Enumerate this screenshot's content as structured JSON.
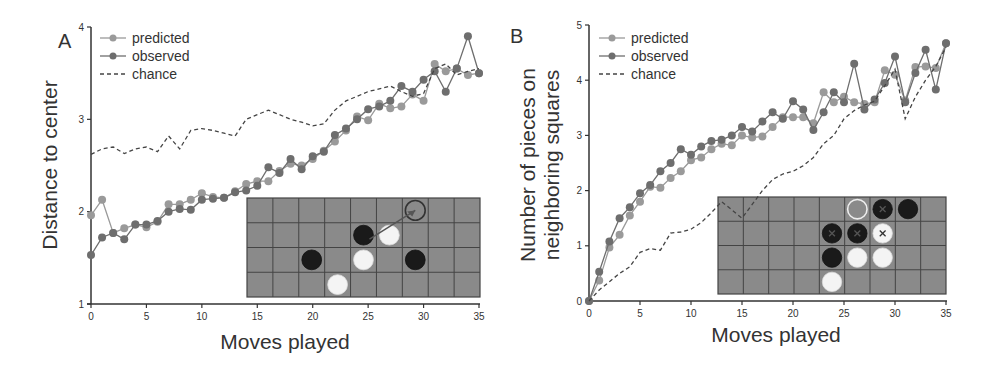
{
  "colors": {
    "predicted": "#9a9a9a",
    "observed": "#6e6e6e",
    "chance": "#444444",
    "axis": "#333333",
    "board": "#8a8a8a",
    "board_grid": "#444444",
    "black_piece": "#1a1a1a",
    "white_piece": "#f4f4f4"
  },
  "chart_data": [
    {
      "type": "line",
      "panel": "A",
      "title": "",
      "xlabel": "Moves played",
      "ylabel": "Distance to center",
      "xlim": [
        0,
        35
      ],
      "ylim": [
        1,
        4
      ],
      "xticks": [
        0,
        5,
        10,
        15,
        20,
        25,
        30,
        35
      ],
      "yticks": [
        1,
        2,
        3,
        4
      ],
      "legend": [
        "predicted",
        "observed",
        "chance"
      ],
      "legend_position": "upper left",
      "x": [
        0,
        1,
        2,
        3,
        4,
        5,
        6,
        7,
        8,
        9,
        10,
        11,
        12,
        13,
        14,
        15,
        16,
        17,
        18,
        19,
        20,
        21,
        22,
        23,
        24,
        25,
        26,
        27,
        28,
        29,
        30,
        31,
        32,
        33,
        34,
        35
      ],
      "series": [
        {
          "name": "predicted",
          "style": "line+marker",
          "values": [
            1.96,
            2.13,
            1.77,
            1.82,
            1.86,
            1.83,
            1.89,
            2.08,
            2.08,
            2.13,
            2.2,
            2.16,
            2.15,
            2.22,
            2.3,
            2.33,
            2.33,
            2.44,
            2.52,
            2.5,
            2.57,
            2.66,
            2.76,
            2.88,
            3.03,
            2.99,
            3.17,
            3.12,
            3.14,
            3.27,
            3.2,
            3.6,
            3.52,
            3.55,
            3.48,
            3.5
          ]
        },
        {
          "name": "observed",
          "style": "line+marker",
          "values": [
            1.53,
            1.72,
            1.77,
            1.7,
            1.86,
            1.86,
            1.9,
            2.0,
            2.03,
            2.02,
            2.13,
            2.14,
            2.15,
            2.21,
            2.23,
            2.28,
            2.48,
            2.42,
            2.57,
            2.46,
            2.6,
            2.65,
            2.83,
            2.9,
            3.0,
            3.11,
            3.14,
            3.2,
            3.36,
            3.3,
            3.43,
            3.52,
            3.3,
            3.55,
            3.9,
            3.5
          ]
        },
        {
          "name": "chance",
          "style": "dashed",
          "values": [
            2.62,
            2.68,
            2.7,
            2.63,
            2.68,
            2.7,
            2.65,
            2.82,
            2.68,
            2.88,
            2.9,
            2.88,
            2.85,
            2.82,
            3.0,
            3.05,
            3.1,
            3.05,
            3.0,
            2.97,
            2.93,
            2.95,
            3.1,
            3.2,
            3.25,
            3.3,
            3.33,
            3.36,
            3.3,
            3.25,
            3.28,
            3.55,
            3.6,
            3.48,
            3.52,
            3.55
          ]
        }
      ],
      "inset_board": {
        "cols": 9,
        "rows": 4,
        "pieces": [
          {
            "col": 6,
            "row": 0,
            "kind": "outline"
          },
          {
            "col": 4,
            "row": 1,
            "kind": "black"
          },
          {
            "col": 5,
            "row": 1,
            "kind": "white"
          },
          {
            "col": 2,
            "row": 2,
            "kind": "black"
          },
          {
            "col": 4,
            "row": 2,
            "kind": "white"
          },
          {
            "col": 6,
            "row": 2,
            "kind": "black"
          },
          {
            "col": 3,
            "row": 3,
            "kind": "white"
          }
        ],
        "arrow": {
          "from": [
            6,
            0
          ],
          "to": [
            4,
            1
          ]
        }
      }
    },
    {
      "type": "line",
      "panel": "B",
      "title": "",
      "xlabel": "Moves played",
      "ylabel": "Number of pieces on neighboring squares",
      "ylabel_lines": [
        "Number of pieces on",
        "neighboring squares"
      ],
      "xlim": [
        0,
        35
      ],
      "ylim": [
        0,
        5
      ],
      "xticks": [
        0,
        5,
        10,
        15,
        20,
        25,
        30,
        35
      ],
      "yticks": [
        0,
        1,
        2,
        3,
        4,
        5
      ],
      "legend": [
        "predicted",
        "observed",
        "chance"
      ],
      "legend_position": "upper left",
      "x": [
        0,
        1,
        2,
        3,
        4,
        5,
        6,
        7,
        8,
        9,
        10,
        11,
        12,
        13,
        14,
        15,
        16,
        17,
        18,
        19,
        20,
        21,
        22,
        23,
        24,
        25,
        26,
        27,
        28,
        29,
        30,
        31,
        32,
        33,
        34,
        35
      ],
      "series": [
        {
          "name": "predicted",
          "style": "line+marker",
          "values": [
            0,
            0.37,
            0.97,
            1.2,
            1.55,
            1.8,
            2.07,
            2.05,
            2.23,
            2.35,
            2.55,
            2.6,
            2.75,
            2.85,
            2.82,
            3.0,
            2.96,
            2.98,
            3.15,
            3.33,
            3.33,
            3.33,
            3.22,
            3.78,
            3.6,
            3.7,
            3.6,
            3.57,
            3.6,
            4.18,
            4.1,
            3.63,
            4.24,
            4.25,
            4.22,
            4.67
          ]
        },
        {
          "name": "observed",
          "style": "line+marker",
          "values": [
            0,
            0.53,
            1.08,
            1.5,
            1.7,
            1.95,
            2.1,
            2.35,
            2.5,
            2.75,
            2.65,
            2.8,
            2.9,
            2.92,
            3.0,
            3.15,
            3.07,
            3.25,
            3.42,
            3.3,
            3.62,
            3.47,
            3.1,
            3.42,
            3.78,
            3.6,
            4.3,
            3.47,
            3.65,
            3.95,
            4.43,
            3.6,
            4.13,
            4.55,
            3.83,
            4.67
          ]
        },
        {
          "name": "chance",
          "style": "dashed",
          "values": [
            0,
            0.2,
            0.35,
            0.5,
            0.62,
            0.88,
            0.95,
            0.92,
            1.23,
            1.25,
            1.3,
            1.42,
            1.6,
            1.8,
            1.65,
            1.5,
            1.75,
            2.0,
            2.2,
            2.3,
            2.35,
            2.45,
            2.6,
            2.85,
            3.0,
            3.3,
            3.45,
            3.55,
            3.62,
            3.9,
            4.2,
            3.3,
            3.7,
            4.0,
            4.25,
            4.6
          ]
        }
      ],
      "inset_board": {
        "cols": 9,
        "rows": 4,
        "pieces": [
          {
            "col": 5,
            "row": 0,
            "kind": "outline"
          },
          {
            "col": 6,
            "row": 0,
            "kind": "black-x"
          },
          {
            "col": 7,
            "row": 0,
            "kind": "black"
          },
          {
            "col": 4,
            "row": 1,
            "kind": "black-x"
          },
          {
            "col": 5,
            "row": 1,
            "kind": "black-x"
          },
          {
            "col": 6,
            "row": 1,
            "kind": "white-x"
          },
          {
            "col": 4,
            "row": 2,
            "kind": "black"
          },
          {
            "col": 5,
            "row": 2,
            "kind": "white"
          },
          {
            "col": 6,
            "row": 2,
            "kind": "white"
          },
          {
            "col": 4,
            "row": 3,
            "kind": "white"
          }
        ]
      }
    }
  ],
  "layout": {
    "panels": [
      {
        "letter": "A",
        "letter_pos": [
          58,
          48
        ],
        "plot": {
          "x0": 91,
          "x1": 479,
          "y_top": 27,
          "y_bottom": 304
        },
        "board": {
          "x": 247,
          "y": 198,
          "w": 233,
          "h": 99
        },
        "legend": {
          "x": 100,
          "y": 38
        },
        "ylabel_pos": [
          45,
          165
        ],
        "xlabel_pos": [
          285,
          349
        ]
      },
      {
        "letter": "B",
        "letter_pos": [
          510,
          43
        ],
        "plot": {
          "x0": 589,
          "x1": 946,
          "y_top": 25,
          "y_bottom": 301
        },
        "board": {
          "x": 718,
          "y": 197,
          "w": 228,
          "h": 97
        },
        "legend": {
          "x": 599,
          "y": 38
        },
        "ylabel_pos": [
          535,
          165
        ],
        "xlabel_pos": [
          776,
          342
        ]
      }
    ]
  }
}
